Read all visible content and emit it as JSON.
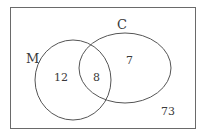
{
  "diagram": {
    "type": "venn",
    "universe": {
      "label": "",
      "outside_count": "73"
    },
    "sets": [
      {
        "id": "M",
        "label": "M",
        "only_count": "12"
      },
      {
        "id": "C",
        "label": "C",
        "only_count": "7"
      }
    ],
    "intersection": {
      "sets": [
        "M",
        "C"
      ],
      "count": "8"
    },
    "colors": {
      "stroke": "#555555",
      "text": "#3a3a3a",
      "background": "#ffffff"
    }
  }
}
